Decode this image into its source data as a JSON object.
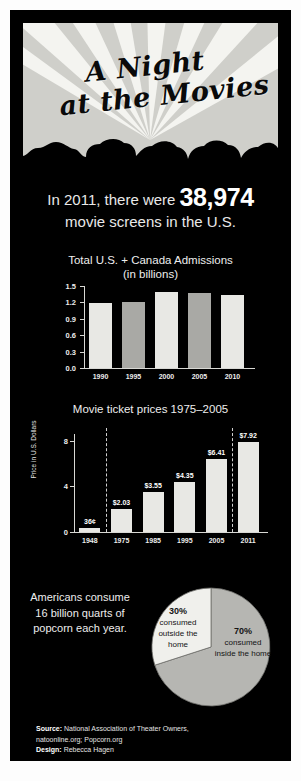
{
  "poster": {
    "title_line1": "A Night",
    "title_line2": "at the Movies"
  },
  "headline": {
    "line1_prefix": "In 2011, there were",
    "big_number": "38,974",
    "line2": "movie screens in the U.S."
  },
  "footer": {
    "source_label": "Source:",
    "source_text": "National Association of Theater Owners,",
    "source_urls": "natoonline.org; Popcorn.org",
    "design_label": "Design:",
    "design_text": "Rebecca Hagen"
  },
  "popcorn": {
    "text": "Americans consume 16 billion quarts of popcorn each year.",
    "slice_outside_pct": "30%",
    "slice_outside_desc": "consumed outside the home",
    "slice_inside_pct": "70%",
    "slice_inside_desc": "consumed inside the home"
  },
  "colors": {
    "poster_bg": "#000000",
    "bar_light": "#e8e8e4",
    "bar_mid": "#a9a9a5",
    "pie_light": "#f0f0ec",
    "pie_mid": "#b6b6b2",
    "text": "#ededed"
  },
  "chart_data": [
    {
      "type": "bar",
      "title": "Total U.S. + Canada Admissions (in billions)",
      "title_line1": "Total U.S. + Canada Admissions",
      "title_line2": "(in billions)",
      "categories": [
        "1990",
        "1995",
        "2000",
        "2005",
        "2010"
      ],
      "values": [
        1.19,
        1.21,
        1.39,
        1.38,
        1.34
      ],
      "xlabel": "",
      "ylabel": "",
      "ylim": [
        0.0,
        1.5
      ],
      "yticks": [
        "0.0",
        "0.3",
        "0.6",
        "0.9",
        "1.2",
        "1.5"
      ],
      "ytick_values": [
        0.0,
        0.3,
        0.6,
        0.9,
        1.2,
        1.5
      ],
      "grid": false,
      "legend": "none"
    },
    {
      "type": "bar",
      "title": "Movie ticket prices 1975–2005",
      "categories": [
        "1948",
        "1975",
        "1985",
        "1995",
        "2005",
        "2011"
      ],
      "values": [
        0.36,
        2.03,
        3.55,
        4.35,
        6.41,
        7.92
      ],
      "data_labels": [
        "36¢",
        "$2.03",
        "$3.55",
        "$4.35",
        "$6.41",
        "$7.92"
      ],
      "xlabel": "",
      "ylabel": "Price in U.S. Dollars",
      "ylim": [
        0,
        8.6
      ],
      "yticks": [
        "0",
        "4",
        "8"
      ],
      "ytick_values": [
        0,
        4,
        8
      ],
      "grid": false,
      "legend": "none",
      "separators_after": [
        "1948",
        "2005"
      ]
    },
    {
      "type": "pie",
      "title": "",
      "labels": [
        "70% consumed inside the home",
        "30% consumed outside the home"
      ],
      "values": [
        70,
        30
      ],
      "legend": "none"
    }
  ]
}
